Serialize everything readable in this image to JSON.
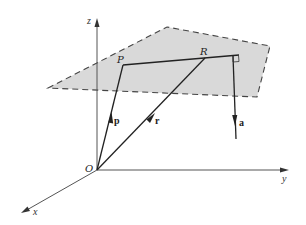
{
  "diagram": {
    "type": "3d-vector-geometry",
    "colors": {
      "plane_fill": "#d9d9d9",
      "plane_border": "#444444",
      "axis": "#555555",
      "vector": "#222222"
    },
    "axes": {
      "x_label": "x",
      "y_label": "y",
      "z_label": "z",
      "origin_label": "O"
    },
    "points": {
      "P_label": "P",
      "R_label": "R"
    },
    "vectors": {
      "p_label": "p",
      "r_label": "r",
      "a_label": "a"
    },
    "annotations": {
      "right_angle": "right-angle marker between line PR and vector a"
    }
  }
}
